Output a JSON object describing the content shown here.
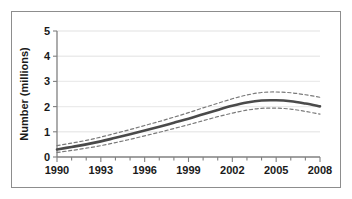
{
  "chart_data": {
    "type": "line",
    "title": "",
    "subtitle": "",
    "xlabel": "",
    "ylabel": "Number (millions)",
    "xlim": [
      1990,
      2008
    ],
    "ylim": [
      0,
      5
    ],
    "grid": true,
    "legend": "none",
    "x_tick_labels": [
      "1990",
      "1993",
      "1996",
      "1999",
      "2002",
      "2005",
      "2008"
    ],
    "x_tick_values": [
      1990,
      1993,
      1996,
      1999,
      2002,
      2005,
      2008
    ],
    "x_minor_ticks": [
      1991,
      1992,
      1994,
      1995,
      1997,
      1998,
      2000,
      2001,
      2003,
      2004,
      2006,
      2007
    ],
    "y_tick_labels": [
      "0",
      "1",
      "2",
      "3",
      "4",
      "5"
    ],
    "y_tick_values": [
      0,
      1,
      2,
      3,
      4,
      5
    ],
    "x": [
      1990,
      1991,
      1992,
      1993,
      1994,
      1995,
      1996,
      1997,
      1998,
      1999,
      2000,
      2001,
      2002,
      2003,
      2004,
      2005,
      2006,
      2007,
      2008
    ],
    "series": [
      {
        "name": "Estimate",
        "style": "solid",
        "color": "#4a4a4a",
        "values": [
          0.3,
          0.4,
          0.5,
          0.62,
          0.76,
          0.9,
          1.05,
          1.2,
          1.36,
          1.52,
          1.7,
          1.87,
          2.03,
          2.16,
          2.24,
          2.25,
          2.21,
          2.12,
          2.01
        ]
      },
      {
        "name": "Upper confidence limit",
        "style": "dashed",
        "color": "#7a7a7a",
        "values": [
          0.45,
          0.55,
          0.66,
          0.79,
          0.94,
          1.09,
          1.25,
          1.41,
          1.58,
          1.76,
          1.95,
          2.13,
          2.31,
          2.46,
          2.56,
          2.58,
          2.55,
          2.47,
          2.37
        ]
      },
      {
        "name": "Lower confidence limit",
        "style": "dashed",
        "color": "#7a7a7a",
        "values": [
          0.18,
          0.26,
          0.35,
          0.45,
          0.57,
          0.7,
          0.84,
          0.98,
          1.13,
          1.28,
          1.44,
          1.6,
          1.74,
          1.86,
          1.93,
          1.94,
          1.9,
          1.81,
          1.7
        ]
      }
    ],
    "colors": {
      "main_line": "#4a4a4a",
      "confidence_line": "#7a7a7a",
      "gridline": "#ebebeb",
      "axis": "#808080",
      "frame_border": "#8d8d8d",
      "background": "#ffffff",
      "text": "#1a1a1a"
    }
  },
  "figure": {
    "border_visible": true
  }
}
